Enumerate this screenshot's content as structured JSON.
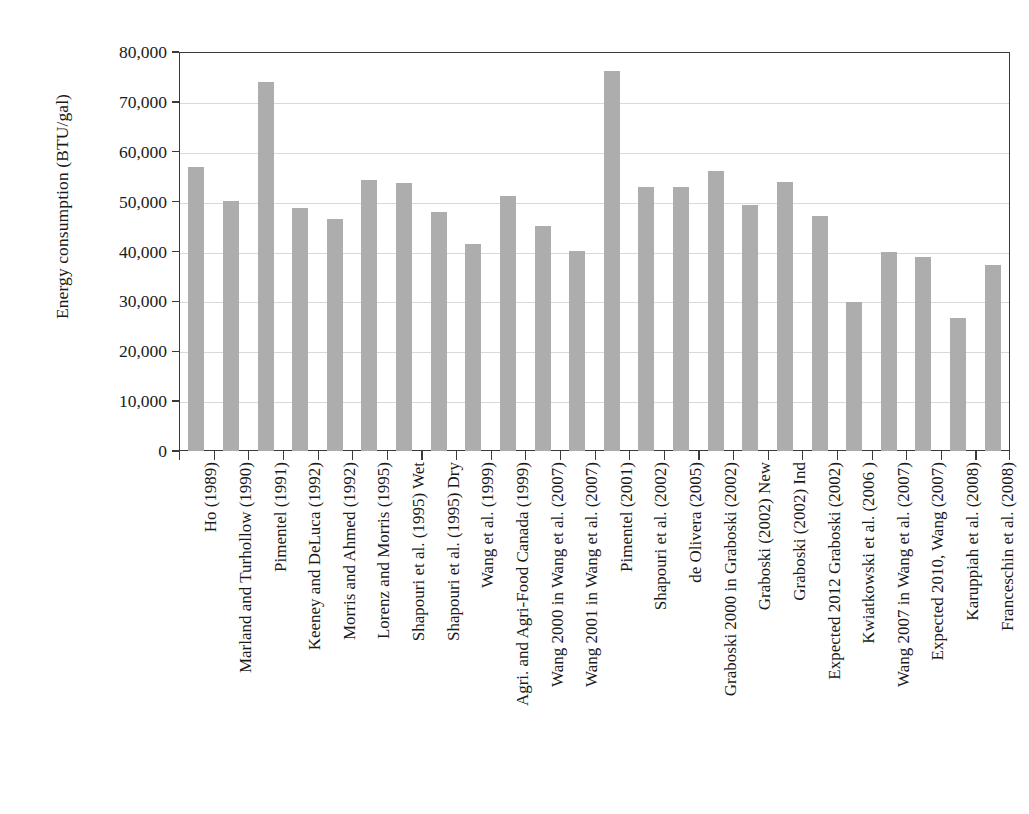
{
  "chart_data": {
    "type": "bar",
    "title": "",
    "xlabel": "",
    "ylabel": "Energy consumption (BTU/gal)",
    "ylim": [
      0,
      80000
    ],
    "ytick_values": [
      0,
      10000,
      20000,
      30000,
      40000,
      50000,
      60000,
      70000,
      80000
    ],
    "ytick_labels": [
      "0",
      "10,000",
      "20,000",
      "30,000",
      "40,000",
      "50,000",
      "60,000",
      "70,000",
      "80,000"
    ],
    "grid": "horizontal",
    "legend": "none",
    "bar_color": "#adadad",
    "axis_color": "#3a3a3a",
    "grid_color": "#d9d9d9",
    "categories": [
      "Ho (1989)",
      "Marland and Turhollow (1990)",
      "Pimentel (1991)",
      "Keeney and DeLuca (1992)",
      "Morris and Ahmed (1992)",
      "Lorenz and Morris (1995)",
      "Shapouri et al. (1995) Wet",
      "Shapouri et al. (1995) Dry",
      "Wang et al. (1999)",
      "Agri. and Agri-Food Canada (1999)",
      "Wang 2000 in Wang et al. (2007)",
      "Wang 2001 in Wang et al. (2007)",
      "Pimentel (2001)",
      "Shapouri et al. (2002)",
      "de Olivera (2005)",
      "Graboski 2000 in Graboski (2002)",
      "Graboski (2002) New",
      "Graboski (2002) Ind",
      "Expected 2012 Graboski (2002)",
      "Kwiatkowski et al. (2006 )",
      "Wang 2007 in Wang et al. (2007)",
      "Expected 2010, Wang (2007)",
      "Karuppiah et al. (2008)",
      "Franceschin et al. (2008)"
    ],
    "values": [
      57000,
      50200,
      74000,
      48700,
      46500,
      54400,
      53700,
      48000,
      41600,
      51100,
      45200,
      40200,
      76100,
      52900,
      52900,
      56200,
      49400,
      53900,
      47200,
      29800,
      40000,
      38900,
      26700,
      37200
    ]
  }
}
